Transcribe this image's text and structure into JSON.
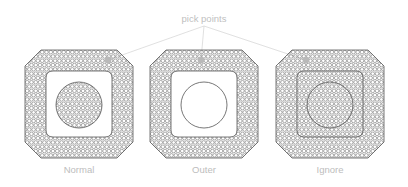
{
  "figure": {
    "background_color": "#ffffff",
    "width": 408,
    "height": 187,
    "callout": {
      "label": "pick points",
      "text_color": "#c0c0c0",
      "x": 204,
      "y": 22,
      "leader_color": "#d2d2d2"
    },
    "mesh": {
      "cell_size": 4.3,
      "line_color": "#4a4a4a",
      "outline_color": "#555555",
      "pick_marker_color": "#b9b9b9",
      "pick_marker_radius": 3.4
    },
    "cases": [
      {
        "id": "normal",
        "label": "Normal",
        "label_x": 79,
        "label_y": 173,
        "body": {
          "cx": 79,
          "cy": 104,
          "half": 54,
          "chamfer": 16
        },
        "inner_square": {
          "cx": 79,
          "cy": 104,
          "half": 33,
          "corner_radius": 7
        },
        "inner_circle": {
          "cx": 79,
          "cy": 105,
          "r": 23
        },
        "mesh_regions": [
          "outer-ring",
          "inner-circle"
        ],
        "empty_regions": [
          "square-band"
        ],
        "pick_point": {
          "x": 108,
          "y": 60
        },
        "leader": {
          "from_x": 204,
          "from_y": 26,
          "to_x": 108,
          "to_y": 60
        }
      },
      {
        "id": "outer",
        "label": "Outer",
        "label_x": 204,
        "label_y": 173,
        "body": {
          "cx": 204,
          "cy": 104,
          "half": 54,
          "chamfer": 16
        },
        "inner_square": {
          "cx": 204,
          "cy": 104,
          "half": 33,
          "corner_radius": 7
        },
        "inner_circle": {
          "cx": 204,
          "cy": 105,
          "r": 23
        },
        "mesh_regions": [
          "outer-ring"
        ],
        "empty_regions": [
          "square-band",
          "inner-circle"
        ],
        "pick_point": {
          "x": 201,
          "y": 60
        },
        "leader": {
          "from_x": 204,
          "from_y": 26,
          "to_x": 201,
          "to_y": 60
        }
      },
      {
        "id": "ignore",
        "label": "Ignore",
        "label_x": 330,
        "label_y": 173,
        "body": {
          "cx": 330,
          "cy": 104,
          "half": 54,
          "chamfer": 16
        },
        "inner_square": {
          "cx": 330,
          "cy": 104,
          "half": 33,
          "corner_radius": 7
        },
        "inner_circle": {
          "cx": 330,
          "cy": 105,
          "r": 23
        },
        "mesh_regions": [
          "full-body"
        ],
        "empty_regions": [],
        "pick_point": {
          "x": 306,
          "y": 60
        },
        "leader": {
          "from_x": 204,
          "from_y": 26,
          "to_x": 306,
          "to_y": 60
        }
      }
    ]
  }
}
